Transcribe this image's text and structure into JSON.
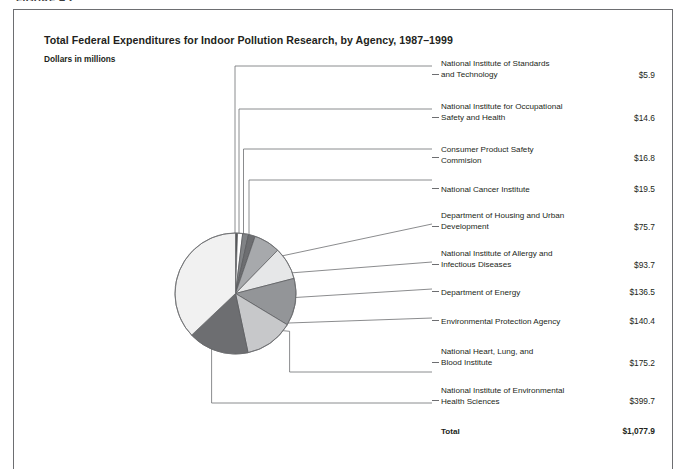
{
  "running_head": "FIGURE 4.2",
  "figure": {
    "title": "Total Federal Expenditures for Indoor Pollution Research, by Agency, 1987–1999",
    "subtitle": "Dollars in millions"
  },
  "legend": {
    "total_label": "Total",
    "total_value": "$1,077.9"
  },
  "chart_data": {
    "type": "pie",
    "title": "Total Federal Expenditures for Indoor Pollution Research, by Agency, 1987–1999",
    "subtitle": "Dollars in millions",
    "unit": "millions of dollars",
    "value_prefix": "$",
    "total": 1077.9,
    "total_label": "Total",
    "legend_position": "right",
    "grid": false,
    "labels": [
      "National Institute of Standards and Technology",
      "National Institute for Occupational Safety and Health",
      "Consumer Product Safety Commision",
      "National Cancer Institute",
      "Department of Housing and Urban Development",
      "National Institute of Allergy and Infectious Diseases",
      "Department of Energy",
      "Environmental Protection Agency",
      "National Heart, Lung, and Blood Institute",
      "National Institute of Environmental Health Sciences"
    ],
    "values": [
      5.9,
      14.6,
      16.8,
      19.5,
      75.7,
      93.7,
      136.5,
      140.4,
      175.2,
      399.7
    ],
    "value_texts": [
      "$5.9",
      "$14.6",
      "$16.8",
      "$19.5",
      "$75.7",
      "$93.7",
      "$136.5",
      "$140.4",
      "$175.2",
      "$399.7"
    ],
    "slice_colors": [
      "#58595b",
      "#ffffff",
      "#808285",
      "#6d6e71",
      "#a7a9ac",
      "#e6e7e8",
      "#939598",
      "#c7c8ca",
      "#6d6e71",
      "#f1f1f1"
    ],
    "slices": [
      {
        "label": "National Institute of Standards and Technology",
        "label_lines": [
          "National Institute of Standards",
          "and Technology"
        ],
        "value": 5.9,
        "value_text": "$5.9",
        "color": "#58595b"
      },
      {
        "label": "National Institute for Occupational Safety and Health",
        "label_lines": [
          "National Institute for Occupational",
          "Safety and Health"
        ],
        "value": 14.6,
        "value_text": "$14.6",
        "color": "#ffffff"
      },
      {
        "label": "Consumer Product Safety Commision",
        "label_lines": [
          "Consumer Product Safety",
          "Commision"
        ],
        "value": 16.8,
        "value_text": "$16.8",
        "color": "#808285"
      },
      {
        "label": "National Cancer Institute",
        "label_lines": [
          "National Cancer Institute"
        ],
        "value": 19.5,
        "value_text": "$19.5",
        "color": "#6d6e71"
      },
      {
        "label": "Department of Housing and Urban Development",
        "label_lines": [
          "Department of Housing and Urban",
          "Development"
        ],
        "value": 75.7,
        "value_text": "$75.7",
        "color": "#a7a9ac"
      },
      {
        "label": "National Institute of Allergy and Infectious Diseases",
        "label_lines": [
          "National Institute of Allergy and",
          "Infectious Diseases"
        ],
        "value": 93.7,
        "value_text": "$93.7",
        "color": "#e6e7e8"
      },
      {
        "label": "Department of Energy",
        "label_lines": [
          "Department of Energy"
        ],
        "value": 136.5,
        "value_text": "$136.5",
        "color": "#939598"
      },
      {
        "label": "Environmental Protection Agency",
        "label_lines": [
          "Environmental Protection Agency"
        ],
        "value": 140.4,
        "value_text": "$140.4",
        "color": "#c7c8ca"
      },
      {
        "label": "National Heart, Lung, and Blood Institute",
        "label_lines": [
          "National Heart, Lung, and",
          "Blood Institute"
        ],
        "value": 175.2,
        "value_text": "$175.2",
        "color": "#6d6e71"
      },
      {
        "label": "National Institute of Environmental Health Sciences",
        "label_lines": [
          "National Institute of Environmental",
          "Health Sciences"
        ],
        "value": 399.7,
        "value_text": "$399.7",
        "color": "#f1f1f1"
      }
    ]
  }
}
